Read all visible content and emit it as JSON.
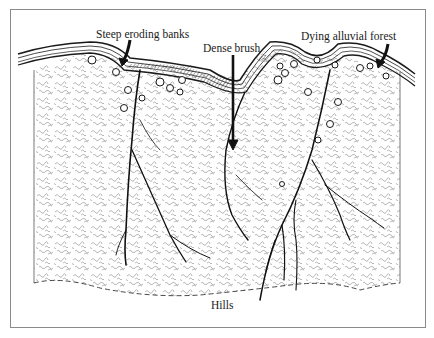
{
  "diagram": {
    "type": "landscape cross-section illustration",
    "labels": {
      "steep_eroding_banks": "Steep eroding banks",
      "dense_brush": "Dense brush",
      "dying_alluvial_forest": "Dying alluvial forest",
      "hills": "Hills"
    },
    "colors": {
      "ink": "#1a1a1a",
      "brush_texture": "#9a9a9a",
      "frame": "#8a8a8a",
      "background": "#ffffff"
    }
  }
}
